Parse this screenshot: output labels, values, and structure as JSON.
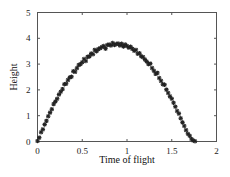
{
  "chart_data": {
    "type": "scatter",
    "title": "",
    "xlabel": "Time of flight",
    "ylabel": "Height",
    "xlim": [
      0,
      2
    ],
    "ylim": [
      0,
      5
    ],
    "xticks": [
      0,
      0.5,
      1,
      1.5,
      2
    ],
    "xtick_labels": [
      "0",
      "0.5",
      "1",
      "1.5",
      "2"
    ],
    "yticks": [
      0,
      1,
      2,
      3,
      4,
      5
    ],
    "ytick_labels": [
      "0",
      "1",
      "2",
      "3",
      "4",
      "5"
    ],
    "grid": false,
    "legend": null,
    "marker": "asterisk",
    "series": [
      {
        "name": "measured height",
        "x": [
          0.0,
          0.02,
          0.04,
          0.06,
          0.08,
          0.1,
          0.12,
          0.14,
          0.16,
          0.18,
          0.2,
          0.22,
          0.24,
          0.26,
          0.28,
          0.3,
          0.32,
          0.34,
          0.36,
          0.38,
          0.4,
          0.42,
          0.44,
          0.46,
          0.48,
          0.5,
          0.52,
          0.54,
          0.56,
          0.58,
          0.6,
          0.62,
          0.64,
          0.66,
          0.68,
          0.7,
          0.72,
          0.74,
          0.76,
          0.78,
          0.8,
          0.82,
          0.84,
          0.86,
          0.88,
          0.9,
          0.92,
          0.94,
          0.96,
          0.98,
          1.0,
          1.02,
          1.04,
          1.06,
          1.08,
          1.1,
          1.12,
          1.14,
          1.16,
          1.18,
          1.2,
          1.22,
          1.24,
          1.26,
          1.28,
          1.3,
          1.32,
          1.34,
          1.36,
          1.38,
          1.4,
          1.42,
          1.44,
          1.46,
          1.48,
          1.5,
          1.52,
          1.54,
          1.56,
          1.58,
          1.6,
          1.62,
          1.64,
          1.66,
          1.68,
          1.7,
          1.72,
          1.74,
          1.76
        ],
        "y": [
          0.02,
          0.15,
          0.36,
          0.47,
          0.66,
          0.8,
          0.98,
          1.12,
          1.25,
          1.45,
          1.55,
          1.66,
          1.82,
          1.93,
          2.03,
          2.22,
          2.24,
          2.38,
          2.48,
          2.51,
          2.72,
          2.7,
          2.84,
          2.96,
          3.0,
          3.07,
          3.2,
          3.12,
          3.28,
          3.3,
          3.41,
          3.38,
          3.55,
          3.5,
          3.58,
          3.62,
          3.66,
          3.7,
          3.6,
          3.74,
          3.76,
          3.72,
          3.82,
          3.74,
          3.78,
          3.8,
          3.72,
          3.79,
          3.68,
          3.76,
          3.7,
          3.64,
          3.67,
          3.59,
          3.52,
          3.55,
          3.4,
          3.42,
          3.3,
          3.27,
          3.18,
          3.1,
          3.0,
          3.02,
          2.85,
          2.74,
          2.62,
          2.66,
          2.46,
          2.35,
          2.22,
          2.2,
          2.01,
          1.88,
          1.75,
          1.66,
          1.5,
          1.35,
          1.18,
          1.08,
          0.9,
          0.74,
          0.6,
          0.44,
          0.3,
          0.22,
          0.1,
          0.04,
          0.01
        ]
      }
    ]
  }
}
